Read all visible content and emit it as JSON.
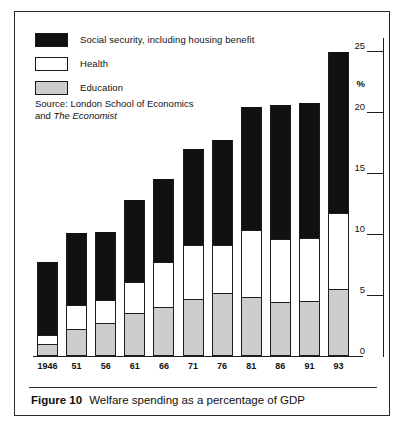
{
  "figure": {
    "caption_number": "Figure 10",
    "caption_text": "Welfare spending as a percentage of GDP"
  },
  "legend": {
    "items": [
      {
        "key": "social",
        "label": "Social security, including housing benefit",
        "color": "#111111"
      },
      {
        "key": "health",
        "label": "Health",
        "color": "#ffffff"
      },
      {
        "key": "education",
        "label": "Education",
        "color": "#cdcdcd"
      }
    ]
  },
  "source": {
    "line1": "Source: London School of Economics",
    "line2_prefix": "and ",
    "line2_italic": "The Economist"
  },
  "axis": {
    "y_unit_symbol": "%",
    "y_ticks": [
      "25",
      "20",
      "15",
      "10",
      "5",
      "0"
    ]
  },
  "chart_data": {
    "type": "bar",
    "title": "Welfare spending as a percentage of GDP",
    "subtitle": "",
    "xlabel": "",
    "ylabel": "%",
    "ylim": [
      0,
      25
    ],
    "yticks": [
      0,
      5,
      10,
      15,
      20,
      25
    ],
    "grid": false,
    "stacked": true,
    "legend_position": "top-left",
    "categories": [
      "1946",
      "51",
      "56",
      "61",
      "66",
      "71",
      "76",
      "81",
      "86",
      "91",
      "93"
    ],
    "series": [
      {
        "name": "Education",
        "color": "#cdcdcd",
        "values": [
          1.0,
          2.2,
          2.7,
          3.5,
          4.0,
          4.7,
          5.2,
          4.8,
          4.4,
          4.5,
          5.5
        ]
      },
      {
        "name": "Health",
        "color": "#ffffff",
        "values": [
          0.7,
          2.0,
          1.9,
          2.6,
          3.7,
          4.4,
          3.9,
          5.5,
          5.2,
          5.2,
          6.2
        ]
      },
      {
        "name": "Social security, including housing benefit",
        "color": "#111111",
        "values": [
          6.0,
          5.9,
          5.6,
          6.7,
          6.8,
          7.9,
          8.6,
          10.1,
          11.0,
          11.0,
          13.2
        ]
      }
    ],
    "totals": [
      7.7,
      10.1,
      10.2,
      12.8,
      14.5,
      17.0,
      17.7,
      20.4,
      20.6,
      20.7,
      24.9
    ]
  }
}
